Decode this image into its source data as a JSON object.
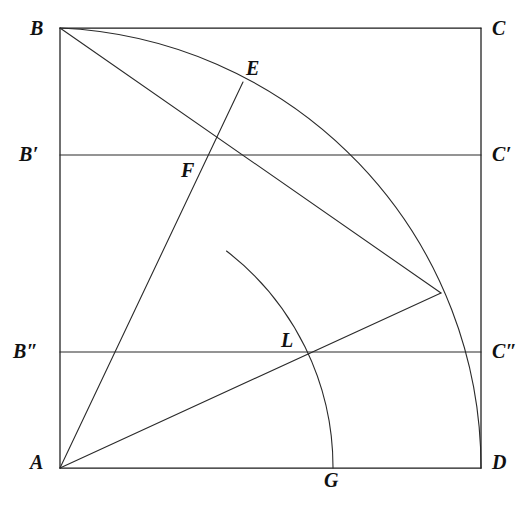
{
  "figure": {
    "background_color": "#ffffff",
    "line_color": "#1b1b1b",
    "label_color": "#111111",
    "square": {
      "corners": {
        "A": {
          "label": "A",
          "x": 60,
          "y": 468
        },
        "B": {
          "label": "B",
          "x": 60,
          "y": 28
        },
        "C": {
          "label": "C",
          "x": 481,
          "y": 28
        },
        "D": {
          "label": "D",
          "x": 481,
          "y": 468
        }
      },
      "side_horizontal": 421,
      "side_vertical": 440
    },
    "points": [
      {
        "label": "B",
        "x": 60,
        "y": 28,
        "label_x": 30,
        "label_y": 18,
        "kind": "corner"
      },
      {
        "label": "C",
        "x": 481,
        "y": 28,
        "label_x": 492,
        "label_y": 18,
        "kind": "corner"
      },
      {
        "label": "A",
        "x": 60,
        "y": 468,
        "label_x": 30,
        "label_y": 452,
        "kind": "corner"
      },
      {
        "label": "D",
        "x": 481,
        "y": 468,
        "label_x": 492,
        "label_y": 452,
        "kind": "corner"
      },
      {
        "label": "B′",
        "x": 60,
        "y": 155,
        "label_x": 20,
        "label_y": 144,
        "kind": "division"
      },
      {
        "label": "C′",
        "x": 481,
        "y": 155,
        "label_x": 492,
        "label_y": 144,
        "kind": "division"
      },
      {
        "label": "B″",
        "x": 60,
        "y": 352,
        "label_x": 14,
        "label_y": 341,
        "kind": "division"
      },
      {
        "label": "C″",
        "x": 481,
        "y": 352,
        "label_x": 492,
        "label_y": 341,
        "kind": "division"
      },
      {
        "label": "E",
        "x": 243,
        "y": 82,
        "label_x": 246,
        "label_y": 58,
        "kind": "arc-intersection"
      },
      {
        "label": "F",
        "x": 205,
        "y": 155,
        "label_x": 182,
        "label_y": 160,
        "kind": "arc-intersection"
      },
      {
        "label": "L",
        "x": 312,
        "y": 352,
        "label_x": 281,
        "label_y": 330,
        "kind": "arc-intersection"
      },
      {
        "label": "G",
        "x": 333,
        "y": 468,
        "label_x": 324,
        "label_y": 470,
        "kind": "arc-endpoint"
      }
    ],
    "arcs": [
      {
        "name": "quadrant-arc-BD",
        "center": "A",
        "center_x": 60,
        "center_y": 468,
        "radius": 440,
        "from": "B",
        "to": "D",
        "path": "M 60 28 A 440 440 0 0 1 481 468"
      },
      {
        "name": "inner-arc-G",
        "center": "A",
        "center_x": 60,
        "center_y": 468,
        "radius": 273,
        "from": "arc-top",
        "to": "G",
        "path": "M 226 250 A 273 273 0 0 1 333 468"
      }
    ],
    "segments": [
      {
        "name": "square-side-AB",
        "from": "A",
        "to": "B",
        "x1": 60,
        "y1": 468,
        "x2": 60,
        "y2": 28
      },
      {
        "name": "square-side-BC",
        "from": "B",
        "to": "C",
        "x1": 60,
        "y1": 28,
        "x2": 481,
        "y2": 28
      },
      {
        "name": "square-side-CD",
        "from": "C",
        "to": "D",
        "x1": 481,
        "y1": 28,
        "x2": 481,
        "y2": 468
      },
      {
        "name": "square-side-AD",
        "from": "A",
        "to": "D",
        "x1": 60,
        "y1": 468,
        "x2": 481,
        "y2": 468
      },
      {
        "name": "chord-B-prime-C-prime",
        "from": "B′",
        "to": "C′",
        "x1": 60,
        "y1": 155,
        "x2": 481,
        "y2": 155
      },
      {
        "name": "chord-B-double-prime-C-double-prime",
        "from": "B″",
        "to": "C″",
        "x1": 60,
        "y1": 352,
        "x2": 481,
        "y2": 352
      },
      {
        "name": "ray-A-through-F-to-E",
        "from": "A",
        "to": "E",
        "x1": 60,
        "y1": 468,
        "x2": 243,
        "y2": 82
      },
      {
        "name": "ray-A-through-L-to-arc",
        "from": "A",
        "to": "arc-point",
        "x1": 60,
        "y1": 468,
        "x2": 441,
        "y2": 293
      },
      {
        "name": "diagonal-B-to-arc",
        "from": "B",
        "to": "arc-point",
        "x1": 60,
        "y1": 28,
        "x2": 441,
        "y2": 293
      }
    ]
  }
}
